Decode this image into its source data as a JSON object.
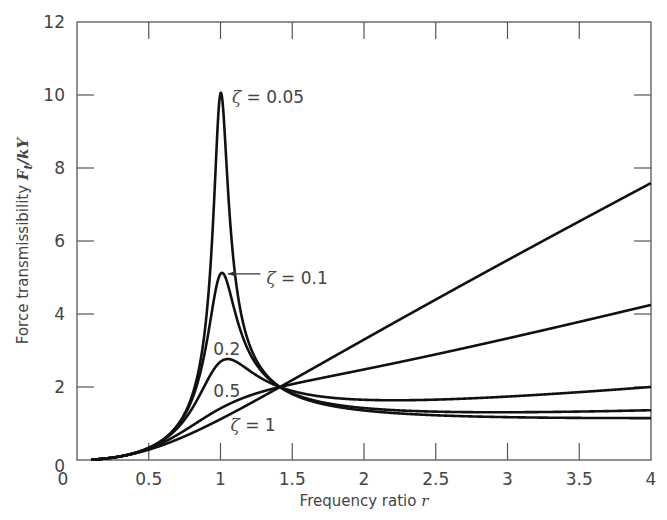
{
  "chart_data": {
    "type": "line",
    "title": "",
    "xlabel": "Frequency ratio r",
    "xlabel_text": "Frequency ratio ",
    "xlabel_var": "r",
    "ylabel": "Force transmissibility Ft/kY",
    "ylabel_text": "Force transmissibility ",
    "ylabel_var": "F",
    "ylabel_sub": "t",
    "ylabel_rest": "/kY",
    "xlim": [
      0,
      4
    ],
    "ylim": [
      0,
      12
    ],
    "grid": false,
    "legend": "inline labels",
    "x_ticks": [
      0,
      0.5,
      1,
      1.5,
      2,
      2.5,
      3,
      3.5,
      4
    ],
    "x_tick_labels": [
      "0",
      "0.5",
      "1",
      "1.5",
      "2",
      "2.5",
      "3",
      "3.5",
      "4"
    ],
    "y_ticks": [
      0,
      2,
      4,
      6,
      8,
      10,
      12
    ],
    "y_tick_labels": [
      "0",
      "2",
      "4",
      "6",
      "8",
      "10",
      "12"
    ],
    "formula": "Ft/kY = r^2 * sqrt((1+(2*zeta*r)^2)/((1-r^2)^2+(2*zeta*r)^2))",
    "x": [
      0.1,
      0.25,
      0.5,
      0.75,
      0.9,
      1.0,
      1.1,
      1.25,
      1.414,
      1.5,
      2.0,
      2.5,
      3.0,
      3.5,
      4.0
    ],
    "series": [
      {
        "name": "ζ = 0.05",
        "zeta": 0.05,
        "values": [
          0.01,
          0.067,
          0.334,
          1.29,
          4.23,
          10.05,
          5.58,
          2.82,
          2.0,
          1.82,
          1.35,
          1.22,
          1.17,
          1.16,
          1.15
        ]
      },
      {
        "name": "ζ = 0.1",
        "zeta": 0.1,
        "values": [
          0.01,
          0.067,
          0.335,
          1.29,
          3.93,
          5.1,
          4.5,
          2.78,
          2.0,
          1.84,
          1.41,
          1.34,
          1.33,
          1.34,
          1.36
        ]
      },
      {
        "name": "0.2",
        "zeta": 0.2,
        "values": [
          0.01,
          0.067,
          0.336,
          1.27,
          2.65,
          2.69,
          2.55,
          2.4,
          2.0,
          1.9,
          1.6,
          1.6,
          1.71,
          1.85,
          2.0
        ]
      },
      {
        "name": "0.5",
        "zeta": 0.5,
        "values": [
          0.01,
          0.067,
          0.343,
          1.06,
          1.46,
          1.41,
          1.74,
          1.99,
          2.0,
          2.03,
          2.33,
          2.77,
          3.27,
          3.76,
          4.25
        ]
      },
      {
        "name": "ζ = 1",
        "zeta": 1.0,
        "values": [
          0.01,
          0.068,
          0.35,
          0.77,
          1.04,
          1.12,
          1.43,
          1.72,
          2.0,
          2.2,
          2.95,
          3.88,
          4.86,
          5.85,
          6.85
        ]
      }
    ],
    "annotations": [
      {
        "text_var": "ζ",
        "text": " = 0.05",
        "x": 1.08,
        "y": 9.95
      },
      {
        "text_var": "ζ",
        "text": " = 0.1",
        "x": 1.32,
        "y": 5.0,
        "arrow_to": [
          1.03,
          5.1
        ]
      },
      {
        "text": "0.2",
        "x": 0.95,
        "y": 3.05
      },
      {
        "text": "0.5",
        "x": 0.95,
        "y": 1.9
      },
      {
        "text_var": "ζ",
        "text": " = 1",
        "x": 1.07,
        "y": 0.95
      }
    ]
  }
}
